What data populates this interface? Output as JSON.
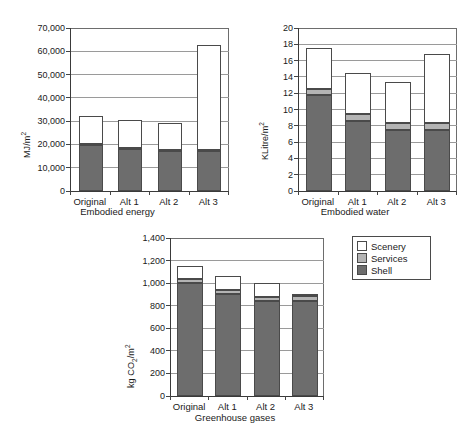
{
  "legend": {
    "position": "right-of-chart3",
    "entries": [
      {
        "label": "Scenery",
        "color": "#ffffff"
      },
      {
        "label": "Services",
        "color": "#b4b4b4"
      },
      {
        "label": "Shell",
        "color": "#6d6d6d"
      }
    ]
  },
  "chart_data": [
    {
      "type": "bar",
      "stacked": true,
      "title": "",
      "xlabel": "Embodied energy",
      "ylabel": "MJ/m2",
      "ylabel_html": "MJ/m<sup>2</sup>",
      "categories": [
        "Original",
        "Alt 1",
        "Alt 2",
        "Alt 3"
      ],
      "ylim": [
        0,
        70000
      ],
      "yticks": [
        0,
        10000,
        20000,
        30000,
        40000,
        50000,
        60000,
        70000
      ],
      "ytick_labels": [
        "0",
        "10,000",
        "20,000",
        "30,000",
        "40,000",
        "50,000",
        "60,000",
        "70,000"
      ],
      "grid": true,
      "series": [
        {
          "name": "Shell",
          "color": "#6d6d6d",
          "values": [
            19700,
            18000,
            17000,
            17200
          ]
        },
        {
          "name": "Services",
          "color": "#b4b4b4",
          "values": [
            600,
            500,
            500,
            500
          ]
        },
        {
          "name": "Scenery",
          "color": "#ffffff",
          "values": [
            11900,
            12100,
            11700,
            45000
          ]
        }
      ],
      "totals": [
        32200,
        30600,
        29200,
        62700
      ]
    },
    {
      "type": "bar",
      "stacked": true,
      "title": "",
      "xlabel": "Embodied water",
      "ylabel": "KLitre/m2",
      "ylabel_html": "KLitre/m<sup>2</sup>",
      "categories": [
        "Original",
        "Alt 1",
        "Alt 2",
        "Alt 3"
      ],
      "ylim": [
        0,
        20
      ],
      "yticks": [
        0,
        2,
        4,
        6,
        8,
        10,
        12,
        14,
        16,
        18,
        20
      ],
      "ytick_labels": [
        "0",
        "2",
        "4",
        "6",
        "8",
        "10",
        "12",
        "14",
        "16",
        "18",
        "20"
      ],
      "grid": true,
      "series": [
        {
          "name": "Shell",
          "color": "#6d6d6d",
          "values": [
            11.8,
            8.6,
            7.5,
            7.5
          ]
        },
        {
          "name": "Services",
          "color": "#b4b4b4",
          "values": [
            0.7,
            0.8,
            0.8,
            0.8
          ]
        },
        {
          "name": "Scenery",
          "color": "#ffffff",
          "values": [
            5.1,
            5.1,
            5.1,
            8.5
          ]
        }
      ],
      "totals": [
        17.6,
        14.5,
        13.4,
        16.8
      ]
    },
    {
      "type": "bar",
      "stacked": true,
      "title": "",
      "xlabel": "Greenhouse gases",
      "ylabel": "kg CO2/m2",
      "ylabel_html": "kg CO<sub>2</sub>/m<sup>2</sup>",
      "categories": [
        "Original",
        "Alt 1",
        "Alt 2",
        "Alt 3"
      ],
      "ylim": [
        0,
        1400
      ],
      "yticks": [
        0,
        200,
        400,
        600,
        800,
        1000,
        1200,
        1400
      ],
      "ytick_labels": [
        "0",
        "200",
        "400",
        "600",
        "800",
        "1,000",
        "1,200",
        "1,400"
      ],
      "grid": true,
      "series": [
        {
          "name": "Shell",
          "color": "#6d6d6d",
          "values": [
            1000,
            900,
            845,
            845
          ]
        },
        {
          "name": "Services",
          "color": "#b4b4b4",
          "values": [
            35,
            40,
            35,
            40
          ]
        },
        {
          "name": "Scenery",
          "color": "#ffffff",
          "values": [
            115,
            120,
            120,
            20
          ]
        }
      ],
      "totals": [
        1150,
        1060,
        1000,
        905
      ]
    }
  ]
}
